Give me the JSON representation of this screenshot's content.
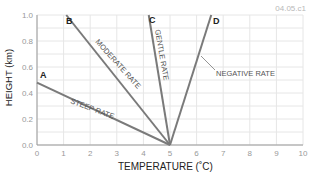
{
  "figure_id": "04.05.c1",
  "chart_data": {
    "type": "line",
    "title": "",
    "xlabel": "TEMPERATURE (˚C)",
    "ylabel": "HEIGHT (km)",
    "xlim": [
      0,
      10
    ],
    "ylim": [
      0.0,
      1.0
    ],
    "x_ticks": [
      "0",
      "1",
      "2",
      "3",
      "4",
      "5",
      "6",
      "7",
      "8",
      "9",
      "10"
    ],
    "y_ticks": [
      "0.0",
      "0.2",
      "0.4",
      "0.6",
      "0.8",
      "1.0"
    ],
    "grid": true,
    "series": [
      {
        "name": "A",
        "label": "STEEP RATE",
        "points": [
          [
            0,
            0.48
          ],
          [
            5,
            0.0
          ]
        ]
      },
      {
        "name": "B",
        "label": "MODERATE RATE",
        "points": [
          [
            1.1,
            1.0
          ],
          [
            5,
            0.0
          ]
        ]
      },
      {
        "name": "C",
        "label": "GENTLE RATE",
        "points": [
          [
            4.2,
            1.0
          ],
          [
            5,
            0.0
          ]
        ]
      },
      {
        "name": "D",
        "label": "NEGATIVE RATE",
        "points": [
          [
            6.55,
            1.0
          ],
          [
            5,
            0.0
          ]
        ]
      }
    ],
    "colors": {
      "line": "#7a7a7a",
      "grid": "#e6e6e6",
      "axis": "#9a9a9a"
    }
  }
}
